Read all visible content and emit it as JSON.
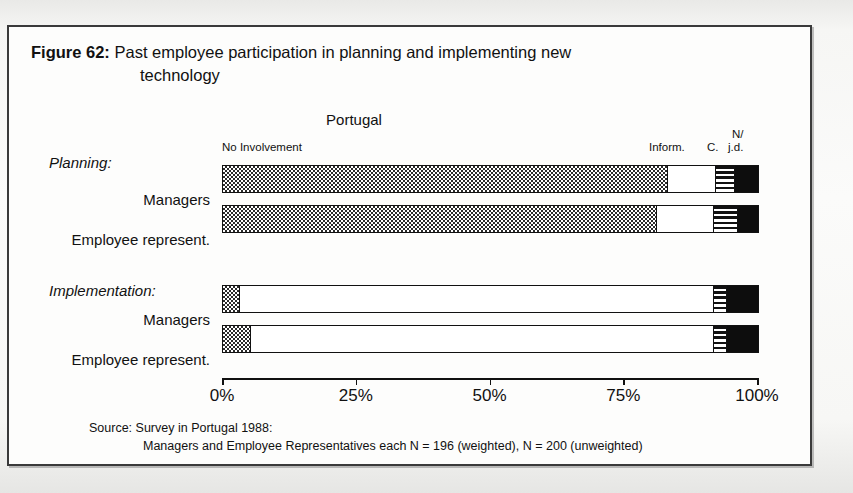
{
  "figure": {
    "number_label": "Figure 62:",
    "caption_line1": "Past employee participation in planning and implementing new",
    "caption_line2": "technology"
  },
  "chart_title": "Portugal",
  "segment_labels": {
    "no_involvement": "No Involvement",
    "inform": "Inform.",
    "consult": "C.",
    "njd_top": "N/",
    "njd_bottom": "j.d."
  },
  "groups": [
    {
      "name": "Planning:"
    },
    {
      "name": "Implementation:"
    }
  ],
  "row_labels": [
    "Managers",
    "Employee represent.",
    "Managers",
    "Employee represent."
  ],
  "axis": {
    "ticks": [
      "0%",
      "25%",
      "50%",
      "75%",
      "100%"
    ],
    "tick_values": [
      0,
      25,
      50,
      75,
      100
    ],
    "min": 0,
    "max": 100
  },
  "source": {
    "line1": "Source: Survey in Portugal 1988:",
    "line2": "Managers and Employee Representatives each N = 196 (weighted), N = 200 (unweighted)"
  },
  "colors": {
    "ink": "#111111",
    "paper": "#fdfdfc",
    "frame": "#3a3a3a",
    "segment_no_involvement": "#2b2b2b",
    "segment_inform": "#ffffff",
    "segment_consult": "#111111",
    "segment_njd": "#0d0d0d"
  },
  "chart_data": {
    "type": "bar",
    "orientation": "horizontal",
    "stacked": true,
    "stacked_normalized_percent": true,
    "title": "Portugal",
    "xlabel": "",
    "ylabel": "",
    "xlim": [
      0,
      100
    ],
    "grid": false,
    "legend_position": "above-bar-ends",
    "tick_labels": [
      "0%",
      "25%",
      "50%",
      "75%",
      "100%"
    ],
    "categories": [
      "Planning: Managers",
      "Planning: Employee represent.",
      "Implementation: Managers",
      "Implementation: Employee represent."
    ],
    "series": [
      {
        "name": "No Involvement",
        "pattern": "checkerboard",
        "values": [
          83,
          81,
          3,
          5
        ]
      },
      {
        "name": "Inform.",
        "pattern": "white",
        "values": [
          9,
          10.5,
          88.5,
          86.5
        ]
      },
      {
        "name": "C.",
        "pattern": "horizontal-stripes",
        "values": [
          3.5,
          4.5,
          2.5,
          2.5
        ]
      },
      {
        "name": "N/ j.d.",
        "pattern": "solid-black",
        "values": [
          4.5,
          4,
          6,
          6
        ]
      }
    ],
    "annotations": [
      "Source: Survey in Portugal 1988:",
      "Managers and Employee Representatives each N = 196 (weighted), N = 200 (unweighted)"
    ]
  }
}
